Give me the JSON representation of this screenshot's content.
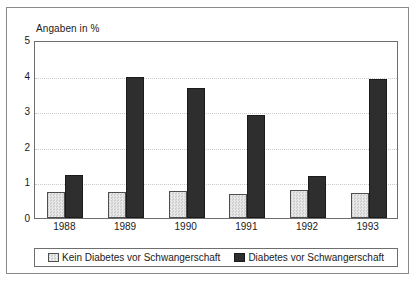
{
  "chart_data": {
    "type": "bar",
    "title": "Angaben in %",
    "xlabel": "",
    "ylabel": "",
    "ylim": [
      0,
      5
    ],
    "yticks": [
      0,
      1,
      2,
      3,
      4,
      5
    ],
    "ytick_labels": [
      "0",
      "1",
      "2",
      "3",
      "4",
      "5"
    ],
    "grid": true,
    "legend_position": "bottom",
    "categories": [
      "1988",
      "1989",
      "1990",
      "1991",
      "1992",
      "1993"
    ],
    "series": [
      {
        "name": "Kein Diabetes vor Schwangerschaft",
        "color": "#dcdcdc",
        "values": [
          0.72,
          0.74,
          0.77,
          0.68,
          0.78,
          0.71
        ]
      },
      {
        "name": "Diabetes vor Schwangerschaft",
        "color": "#2e2e2e",
        "values": [
          1.22,
          3.95,
          3.66,
          2.88,
          1.18,
          3.91
        ]
      }
    ]
  },
  "legend": {
    "items": [
      {
        "label": "Kein Diabetes vor Schwangerschaft",
        "swatch": "light"
      },
      {
        "label": "Diabetes vor Schwangerschaft",
        "swatch": "dark"
      }
    ]
  }
}
